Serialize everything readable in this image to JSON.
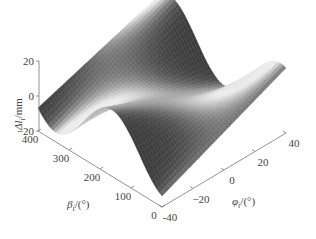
{
  "chart_data": {
    "type": "surface",
    "title": "",
    "colormap": "grayscale",
    "x_axis": {
      "name": "phi",
      "label_symbol": "φ",
      "label_subscript": "i",
      "label_unit": "/(°)",
      "range": [
        -40,
        40
      ],
      "ticks": [
        -40,
        -20,
        0,
        20,
        40
      ],
      "tick_labels": [
        "-40",
        "−20",
        "0",
        "20",
        "40"
      ]
    },
    "y_axis": {
      "name": "beta",
      "label_symbol": "β",
      "label_subscript": "i",
      "label_unit": "/(°)",
      "range": [
        0,
        400
      ],
      "ticks": [
        0,
        100,
        200,
        300,
        400
      ],
      "tick_labels": [
        "0",
        "100",
        "200",
        "300",
        "400"
      ]
    },
    "z_axis": {
      "name": "delta_l",
      "label_symbol": "Δl",
      "label_subscript": "i",
      "label_unit": "/mm",
      "range": [
        -20,
        20
      ],
      "ticks": [
        -20,
        0,
        20
      ],
      "tick_labels": [
        "−20",
        "0",
        "20"
      ]
    },
    "surface": {
      "description": "Saddle-like surface; Δl varies with φ (approx. linear tilt) modulated sinusoidally by β, with peak near φ=40,β=400 corner and troughs near φ=-40,β≈0 and φ=-40,β≈400",
      "model": "dl = 0.45*phi * cos(beta_rad) + 6*sin(beta_rad)",
      "grid_phi": [
        -40,
        -30,
        -20,
        -10,
        0,
        10,
        20,
        30,
        40
      ],
      "grid_beta": [
        0,
        50,
        100,
        150,
        200,
        250,
        300,
        350,
        400
      ]
    }
  }
}
